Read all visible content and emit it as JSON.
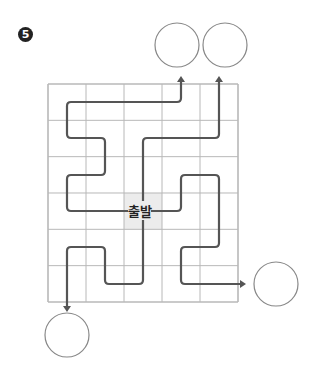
{
  "problem": {
    "number_label": "5"
  },
  "maze": {
    "start_label": "출발",
    "colors": {
      "grid": "#b8b8b8",
      "path": "#555555",
      "start_cell": "#ececec",
      "circle": "#888888"
    },
    "grid": {
      "x0": 48,
      "y0": 84,
      "cols": 5,
      "rows": 6,
      "cell_w": 38,
      "cell_h": 36.33
    },
    "start": {
      "x": 143,
      "y": 211
    },
    "paths": [
      {
        "id": "path-top-left",
        "points": [
          [
            143,
            211
          ],
          [
            67,
            211
          ],
          [
            67,
            175
          ],
          [
            105,
            175
          ],
          [
            105,
            138
          ],
          [
            67,
            138
          ],
          [
            67,
            102
          ],
          [
            181,
            102
          ],
          [
            181,
            76
          ]
        ]
      },
      {
        "id": "path-top-right",
        "points": [
          [
            143,
            211
          ],
          [
            143,
            138
          ],
          [
            219,
            138
          ],
          [
            219,
            76
          ]
        ]
      },
      {
        "id": "path-right",
        "points": [
          [
            143,
            211
          ],
          [
            181,
            211
          ],
          [
            181,
            175
          ],
          [
            219,
            175
          ],
          [
            219,
            247
          ],
          [
            181,
            247
          ],
          [
            181,
            284
          ],
          [
            246,
            284
          ]
        ]
      },
      {
        "id": "path-bottom",
        "points": [
          [
            143,
            211
          ],
          [
            143,
            284
          ],
          [
            105,
            284
          ],
          [
            105,
            247
          ],
          [
            67,
            247
          ],
          [
            67,
            312
          ]
        ]
      }
    ],
    "answer_circles": [
      {
        "id": "circle-top-left",
        "cx": 177,
        "cy": 45,
        "r": 22
      },
      {
        "id": "circle-top-right",
        "cx": 225,
        "cy": 45,
        "r": 22
      },
      {
        "id": "circle-right",
        "cx": 276,
        "cy": 284,
        "r": 22
      },
      {
        "id": "circle-bottom",
        "cx": 67,
        "cy": 335,
        "r": 22
      }
    ]
  }
}
